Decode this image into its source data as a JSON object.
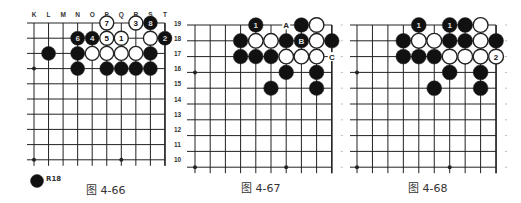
{
  "colors": {
    "line": "#222222",
    "black_stone": "#111111",
    "white_stone": "#ffffff",
    "text": "#333333"
  },
  "boards": [
    {
      "id": "fig-4-66",
      "caption": "图 4-66",
      "x0": 34,
      "dx": 14.55,
      "y0": 23,
      "dy": 15.2,
      "left_ext": 27,
      "bottom_ext": 6,
      "col_labels": [
        "K",
        "L",
        "M",
        "N",
        "O",
        "P",
        "Q",
        "R",
        "S",
        "T"
      ],
      "row_labels": [
        "19",
        "18",
        "17",
        "16",
        "15",
        "14",
        "13",
        "12",
        "11",
        "10"
      ],
      "star_points": [
        [
          0,
          3
        ],
        [
          0,
          9
        ],
        [
          6,
          9
        ]
      ],
      "stones": [
        {
          "c": 5,
          "r": 0,
          "color": "white",
          "label": "7"
        },
        {
          "c": 7,
          "r": 0,
          "color": "white",
          "label": "3"
        },
        {
          "c": 8,
          "r": 0,
          "color": "black",
          "label": "8"
        },
        {
          "c": 3,
          "r": 1,
          "color": "black",
          "label": "6"
        },
        {
          "c": 4,
          "r": 1,
          "color": "black",
          "label": "4"
        },
        {
          "c": 5,
          "r": 1,
          "color": "white",
          "label": "5"
        },
        {
          "c": 6,
          "r": 1,
          "color": "white",
          "label": "1"
        },
        {
          "c": 8,
          "r": 1,
          "color": "white",
          "label": ""
        },
        {
          "c": 9,
          "r": 1,
          "color": "black",
          "label": "2"
        },
        {
          "c": 1,
          "r": 2,
          "color": "black",
          "label": ""
        },
        {
          "c": 3,
          "r": 2,
          "color": "black",
          "label": ""
        },
        {
          "c": 4,
          "r": 2,
          "color": "white",
          "label": ""
        },
        {
          "c": 5,
          "r": 2,
          "color": "white",
          "label": ""
        },
        {
          "c": 6,
          "r": 2,
          "color": "white",
          "label": ""
        },
        {
          "c": 7,
          "r": 2,
          "color": "white",
          "label": ""
        },
        {
          "c": 8,
          "r": 2,
          "color": "black",
          "label": ""
        },
        {
          "c": 3,
          "r": 3,
          "color": "black",
          "label": ""
        },
        {
          "c": 5,
          "r": 3,
          "color": "black",
          "label": ""
        },
        {
          "c": 6,
          "r": 3,
          "color": "black",
          "label": ""
        },
        {
          "c": 7,
          "r": 3,
          "color": "black",
          "label": ""
        },
        {
          "c": 8,
          "r": 3,
          "color": "black",
          "label": ""
        }
      ],
      "marks": [],
      "legend": {
        "stone_color": "black",
        "label": "R18"
      }
    },
    {
      "id": "fig-4-67",
      "caption": "图 4-67",
      "x0": 195,
      "dx": 15.2,
      "y0": 25,
      "dy": 15.8,
      "left_ext": 187,
      "bottom_ext": 6,
      "col_labels": [],
      "row_labels": [],
      "star_points": [
        [
          0,
          3
        ],
        [
          0,
          9
        ],
        [
          6,
          9
        ]
      ],
      "stones": [
        {
          "c": 4,
          "r": 0,
          "color": "black",
          "label": "1"
        },
        {
          "c": 7,
          "r": 0,
          "color": "black",
          "label": ""
        },
        {
          "c": 8,
          "r": 0,
          "color": "white",
          "label": ""
        },
        {
          "c": 3,
          "r": 1,
          "color": "black",
          "label": ""
        },
        {
          "c": 4,
          "r": 1,
          "color": "white",
          "label": ""
        },
        {
          "c": 5,
          "r": 1,
          "color": "white",
          "label": ""
        },
        {
          "c": 6,
          "r": 1,
          "color": "black",
          "label": ""
        },
        {
          "c": 7,
          "r": 1,
          "color": "black",
          "label": "B"
        },
        {
          "c": 8,
          "r": 1,
          "color": "white",
          "label": ""
        },
        {
          "c": 9,
          "r": 1,
          "color": "black",
          "label": ""
        },
        {
          "c": 3,
          "r": 2,
          "color": "black",
          "label": ""
        },
        {
          "c": 4,
          "r": 2,
          "color": "black",
          "label": ""
        },
        {
          "c": 5,
          "r": 2,
          "color": "black",
          "label": ""
        },
        {
          "c": 6,
          "r": 2,
          "color": "white",
          "label": ""
        },
        {
          "c": 7,
          "r": 2,
          "color": "white",
          "label": ""
        },
        {
          "c": 8,
          "r": 2,
          "color": "white",
          "label": ""
        },
        {
          "c": 6,
          "r": 3,
          "color": "black",
          "label": ""
        },
        {
          "c": 8,
          "r": 3,
          "color": "black",
          "label": ""
        },
        {
          "c": 5,
          "r": 4,
          "color": "black",
          "label": ""
        },
        {
          "c": 8,
          "r": 4,
          "color": "black",
          "label": ""
        }
      ],
      "marks": [
        {
          "c": 6,
          "r": 0,
          "label": "A"
        },
        {
          "c": 9,
          "r": 2,
          "label": "C"
        }
      ]
    },
    {
      "id": "fig-4-68",
      "caption": "图 4-68",
      "x0": 357,
      "dx": 15.45,
      "y0": 25,
      "dy": 15.8,
      "left_ext": 350,
      "bottom_ext": 6,
      "col_labels": [],
      "row_labels": [],
      "star_points": [
        [
          0,
          3
        ],
        [
          0,
          9
        ],
        [
          6,
          9
        ]
      ],
      "stones": [
        {
          "c": 4,
          "r": 0,
          "color": "black",
          "label": "1"
        },
        {
          "c": 6,
          "r": 0,
          "color": "black",
          "label": "1"
        },
        {
          "c": 7,
          "r": 0,
          "color": "black",
          "label": ""
        },
        {
          "c": 8,
          "r": 0,
          "color": "white",
          "label": ""
        },
        {
          "c": 3,
          "r": 1,
          "color": "black",
          "label": ""
        },
        {
          "c": 4,
          "r": 1,
          "color": "white",
          "label": ""
        },
        {
          "c": 5,
          "r": 1,
          "color": "white",
          "label": ""
        },
        {
          "c": 6,
          "r": 1,
          "color": "black",
          "label": ""
        },
        {
          "c": 7,
          "r": 1,
          "color": "black",
          "label": ""
        },
        {
          "c": 8,
          "r": 1,
          "color": "white",
          "label": ""
        },
        {
          "c": 9,
          "r": 1,
          "color": "black",
          "label": ""
        },
        {
          "c": 3,
          "r": 2,
          "color": "black",
          "label": ""
        },
        {
          "c": 4,
          "r": 2,
          "color": "black",
          "label": ""
        },
        {
          "c": 5,
          "r": 2,
          "color": "black",
          "label": ""
        },
        {
          "c": 6,
          "r": 2,
          "color": "white",
          "label": ""
        },
        {
          "c": 7,
          "r": 2,
          "color": "white",
          "label": ""
        },
        {
          "c": 8,
          "r": 2,
          "color": "white",
          "label": ""
        },
        {
          "c": 9,
          "r": 2,
          "color": "white",
          "label": "2"
        },
        {
          "c": 6,
          "r": 3,
          "color": "black",
          "label": ""
        },
        {
          "c": 8,
          "r": 3,
          "color": "black",
          "label": ""
        },
        {
          "c": 5,
          "r": 4,
          "color": "black",
          "label": ""
        },
        {
          "c": 8,
          "r": 4,
          "color": "black",
          "label": ""
        }
      ],
      "marks": []
    }
  ]
}
